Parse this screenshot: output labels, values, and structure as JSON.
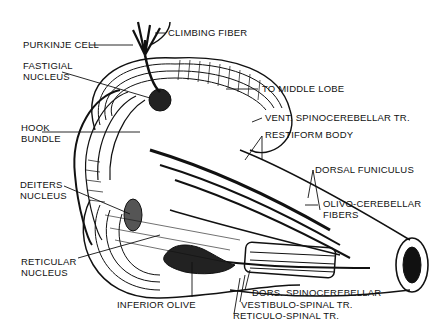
{
  "diagram": {
    "colors": {
      "ink": "#111111",
      "background": "#ffffff"
    },
    "labels": [
      {
        "id": "climbing-fiber",
        "text": "CLIMBING FIBER"
      },
      {
        "id": "purkinje-cell",
        "text": "PURKINJE CELL"
      },
      {
        "id": "fastigial-nucleus",
        "line1": "FASTIGIAL",
        "line2": "NUCLEUS"
      },
      {
        "id": "to-middle-lobe",
        "text": "TO MIDDLE LOBE"
      },
      {
        "id": "vent-spinocerebellar",
        "text": "VENT. SPINOCEREBELLAR TR."
      },
      {
        "id": "restiform-body",
        "text": "RESTIFORM BODY"
      },
      {
        "id": "hook-bundle",
        "line1": "HOOK",
        "line2": "BUNDLE"
      },
      {
        "id": "dorsal-funiculus",
        "text": "DORSAL FUNICULUS"
      },
      {
        "id": "deiters-nucleus",
        "line1": "DEITERS",
        "line2": "NUCLEUS"
      },
      {
        "id": "olivo-cerebellar",
        "line1": "OLIVO-CEREBELLAR",
        "line2": "FIBERS"
      },
      {
        "id": "reticular-nucleus",
        "line1": "RETICULAR",
        "line2": "NUCLEUS"
      },
      {
        "id": "dors-spinocerebellar",
        "text": "DORS. SPINOCEREBELLAR"
      },
      {
        "id": "inferior-olive",
        "text": "INFERIOR OLIVE"
      },
      {
        "id": "vestibulo-spinal",
        "text": "VESTIBULO-SPINAL TR."
      },
      {
        "id": "reticulo-spinal",
        "text": "RETICULO-SPINAL TR."
      }
    ]
  }
}
